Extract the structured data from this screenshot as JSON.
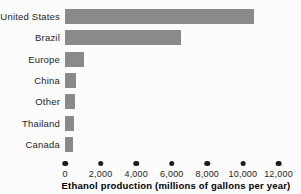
{
  "chart_data": {
    "type": "bar",
    "orientation": "horizontal",
    "categories": [
      "United States",
      "Brazil",
      "Europe",
      "China",
      "Other",
      "Thailand",
      "Canada"
    ],
    "values": [
      10600,
      6500,
      1040,
      600,
      570,
      510,
      420
    ],
    "xlabel": "Ethanol production (millions of gallons per year)",
    "xlim": [
      0,
      12000
    ],
    "xticks": [
      0,
      2000,
      4000,
      6000,
      8000,
      10000,
      12000
    ],
    "xtick_labels": [
      "0",
      "2,000",
      "4,000",
      "6,000",
      "8,000",
      "10,000",
      "12,000"
    ],
    "grid": false,
    "legend": "none",
    "tick_marker": "dot-icon",
    "colors": {
      "bar": "#8a8a8a",
      "tick_dot": "#1c1c1c",
      "text": "#1e1e1e",
      "background": "#fcfcfc"
    }
  }
}
